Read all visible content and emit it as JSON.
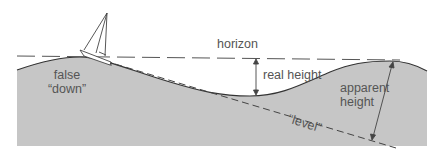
{
  "diagram": {
    "labels": {
      "horizon": "horizon",
      "false_down_line1": "false",
      "false_down_line2": "“down”",
      "real_height": "real height",
      "apparent_height_line1": "apparent",
      "apparent_height_line2": "height",
      "level": "“level”"
    },
    "colors": {
      "ground": "#c6c6c6",
      "outline": "#444444",
      "text": "#555555",
      "background": "#ffffff"
    }
  }
}
